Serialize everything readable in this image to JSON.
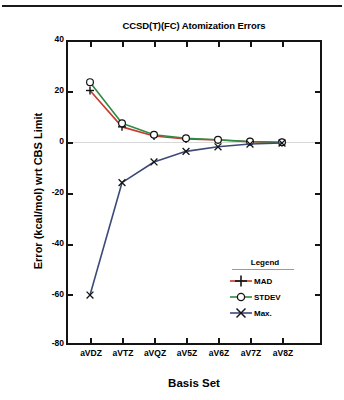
{
  "figure": {
    "top_rule": true
  },
  "chart_data": {
    "type": "line",
    "title": "CCSD(T)(FC) Atomization Errors",
    "xlabel": "Basis Set",
    "ylabel": "Error (kcal/mol) wrt CBS Limit",
    "categories": [
      "aVDZ",
      "aVTZ",
      "aVQZ",
      "aV5Z",
      "aV6Z",
      "aV7Z",
      "aV8Z"
    ],
    "ylim": [
      -80,
      40
    ],
    "yticks": [
      40,
      20,
      0,
      -20,
      -40,
      -60,
      -80
    ],
    "ytick_labels": [
      "40",
      "20",
      "0",
      "-20",
      "-40",
      "-60",
      "-80"
    ],
    "grid": false,
    "legend_position": "lower-right",
    "legend_title": "Legend",
    "series": [
      {
        "name": "MAD",
        "color": "#c9392b",
        "marker": "plus",
        "values": [
          20.0,
          5.6,
          2.0,
          0.8,
          0.4,
          -0.3,
          -0.6
        ]
      },
      {
        "name": "STDEV",
        "color": "#2e8b45",
        "marker": "circle",
        "values": [
          23.3,
          7.0,
          2.5,
          1.1,
          0.5,
          -0.2,
          -0.5
        ]
      },
      {
        "name": "Max.",
        "color": "#3c4a78",
        "marker": "x",
        "values": [
          -61.0,
          -16.5,
          -8.3,
          -4.1,
          -2.3,
          -1.2,
          -0.8
        ]
      }
    ]
  }
}
